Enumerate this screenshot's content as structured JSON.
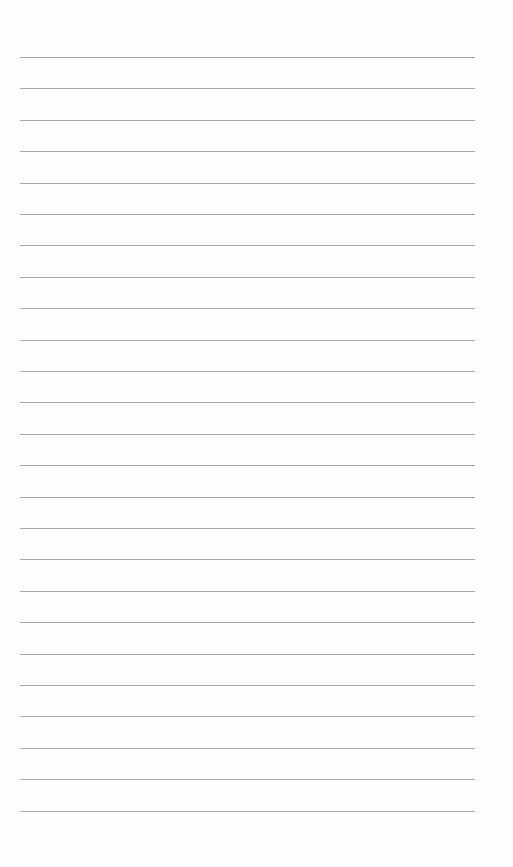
{
  "page": {
    "type": "lined-paper",
    "line_count": 25,
    "first_line_y": 57,
    "line_spacing": 31.4,
    "line_left": 20,
    "line_width": 455,
    "line_color": "#a9a9a9",
    "background": "#fefefe"
  }
}
